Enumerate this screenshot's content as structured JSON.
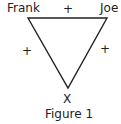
{
  "diagram": {
    "nodes": [
      {
        "id": "frank",
        "label": "Frank"
      },
      {
        "id": "joe",
        "label": "Joe"
      },
      {
        "id": "x",
        "label": "X"
      }
    ],
    "edges": [
      {
        "from": "frank",
        "to": "joe",
        "sign": "+"
      },
      {
        "from": "frank",
        "to": "x",
        "sign": "+"
      },
      {
        "from": "joe",
        "to": "x",
        "sign": "+"
      }
    ],
    "caption": "Figure 1"
  }
}
